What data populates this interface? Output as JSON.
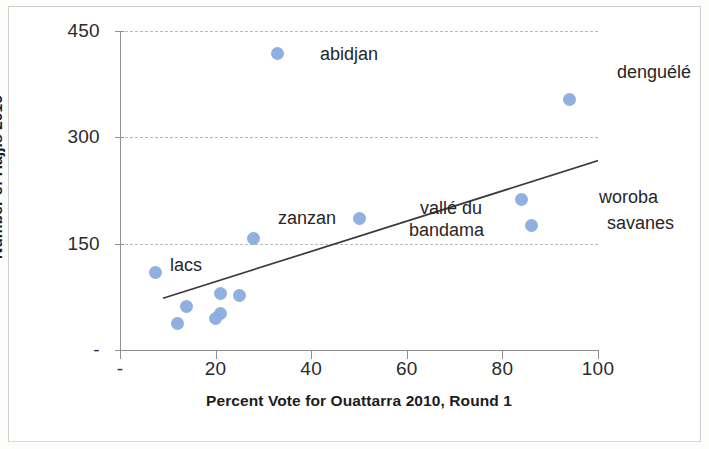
{
  "chart_data": {
    "type": "scatter",
    "title": "",
    "xlabel": "Percent Vote for Ouattarra 2010, Round 1",
    "ylabel": "Number of Hajjis 2016",
    "xlim": [
      0,
      100
    ],
    "ylim": [
      0,
      450
    ],
    "grid": true,
    "legend": "none",
    "x_ticks": [
      "-",
      "20",
      "40",
      "60",
      "80",
      "100"
    ],
    "x_tick_values": [
      0,
      20,
      40,
      60,
      80,
      100
    ],
    "y_ticks": [
      "-",
      "150",
      "300",
      "450"
    ],
    "y_tick_values": [
      0,
      150,
      300,
      450
    ],
    "marker_color": "#8aacde",
    "trendline": {
      "type": "linear",
      "x_start": 9,
      "y_start": 73,
      "x_end": 107,
      "y_end": 282,
      "color": "#3a3a3a"
    },
    "points": [
      {
        "label": "abidjan",
        "x": 33,
        "y": 418
      },
      {
        "label": "denguélé",
        "x": 94,
        "y": 353
      },
      {
        "label": "woroba",
        "x": 84,
        "y": 213
      },
      {
        "label": "savanes",
        "x": 86,
        "y": 176
      },
      {
        "label": "vallé du\nbandama",
        "x": 50,
        "y": 185
      },
      {
        "label": "zanzan",
        "x": 28,
        "y": 157
      },
      {
        "label": "lacs",
        "x": 7.5,
        "y": 110
      },
      {
        "label": "",
        "x": 12,
        "y": 38
      },
      {
        "label": "",
        "x": 14,
        "y": 62
      },
      {
        "label": "",
        "x": 20,
        "y": 45
      },
      {
        "label": "",
        "x": 21,
        "y": 52
      },
      {
        "label": "",
        "x": 21,
        "y": 79
      },
      {
        "label": "",
        "x": 25,
        "y": 77
      }
    ],
    "point_labels": [
      {
        "text": "abidjan",
        "x": 320,
        "y": 44
      },
      {
        "text": "denguélé",
        "x": 617,
        "y": 62
      },
      {
        "text": "woroba",
        "x": 599,
        "y": 187
      },
      {
        "text": "savanes",
        "x": 607,
        "y": 213
      },
      {
        "text": "vallé du",
        "x": 420,
        "y": 198
      },
      {
        "text": "bandama",
        "x": 409,
        "y": 220
      },
      {
        "text": "zanzan",
        "x": 278,
        "y": 208
      },
      {
        "text": "lacs",
        "x": 170,
        "y": 255
      }
    ]
  }
}
